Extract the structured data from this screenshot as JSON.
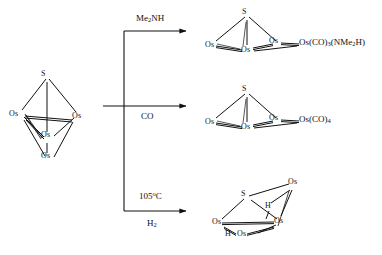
{
  "figure": {
    "kind": "chemical-reaction-scheme"
  },
  "reactant": {
    "name": "os4s-cluster",
    "vertices": {
      "s_top": "S",
      "os_left": "Os",
      "os_right": "Os",
      "os_center": "Os",
      "os_bottom": "Os"
    }
  },
  "branches": [
    {
      "id": "branch-amine",
      "condition_above": "Me2NH",
      "condition_above_parts": {
        "pre": "Me",
        "sub": "2",
        "post": "NH"
      },
      "condition_below": "",
      "product_label": "Os(CO)3(NMe2H)",
      "product_label_parts": [
        {
          "t": "Os(CO)",
          "k": "n"
        },
        {
          "t": "3",
          "k": "sub"
        },
        {
          "t": "(NMe",
          "k": "n"
        },
        {
          "t": "2",
          "k": "sub"
        },
        {
          "t": "H)",
          "k": "n"
        }
      ],
      "cluster_vertices": {
        "s": "S",
        "os_left": "Os",
        "os_right": "Os",
        "os_bottom": "Os"
      }
    },
    {
      "id": "branch-co",
      "condition_above": "CO",
      "condition_below": "",
      "product_label": "Os(CO)4",
      "product_label_parts": [
        {
          "t": "Os(CO)",
          "k": "n"
        },
        {
          "t": "4",
          "k": "sub"
        }
      ],
      "cluster_vertices": {
        "s": "S",
        "os_left": "Os",
        "os_right": "Os",
        "os_bottom": "Os"
      }
    },
    {
      "id": "branch-hydrogen",
      "condition_above": "105°C",
      "condition_above_parts": {
        "pre": "105",
        "sup": "o",
        "post": "C"
      },
      "condition_below": "H2",
      "condition_below_parts": {
        "pre": "H",
        "sub": "2"
      },
      "product_label": "",
      "cluster_vertices": {
        "s": "S",
        "os_top_right": "Os",
        "os_left": "Os",
        "os_mid_right": "Os",
        "os_bottom": "Os",
        "h_bridge_upper": "H",
        "h_bridge_lower": "H"
      }
    }
  ],
  "colors": {
    "ink": "#111111",
    "background": "#ffffff"
  }
}
